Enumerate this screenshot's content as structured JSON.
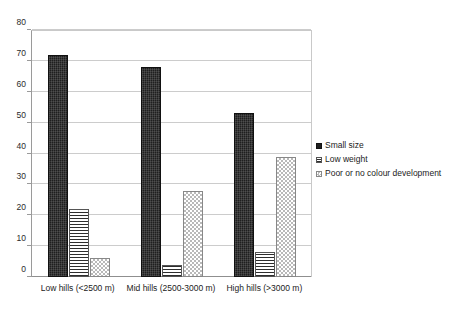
{
  "chart_data": {
    "type": "bar",
    "title": "",
    "subtitle": "",
    "xlabel": "",
    "ylabel": "",
    "ylim": [
      0,
      80
    ],
    "ytick_step": 10,
    "yticks": [
      "0",
      "10",
      "20",
      "30",
      "40",
      "50",
      "60",
      "70",
      "80"
    ],
    "grid": true,
    "legend_position": "right",
    "categories": [
      "Low hills (<2500 m)",
      "Mid hills (2500-3000 m)",
      "High hills (>3000 m)"
    ],
    "series": [
      {
        "name": "Small size",
        "values": [
          72,
          68,
          53
        ],
        "pattern": "solid-black",
        "color": "#1f1f1f"
      },
      {
        "name": "Low weight",
        "values": [
          22,
          4,
          8
        ],
        "pattern": "horizontal-stripes",
        "color": "#2e2e2e"
      },
      {
        "name": "Poor or no colour development",
        "values": [
          6,
          28,
          39
        ],
        "pattern": "dotted-checker",
        "color": "#b9b9b9"
      }
    ]
  },
  "legend": {
    "items": [
      {
        "label": "Small size"
      },
      {
        "label": "Low weight"
      },
      {
        "label": "Poor or no colour development"
      }
    ]
  }
}
